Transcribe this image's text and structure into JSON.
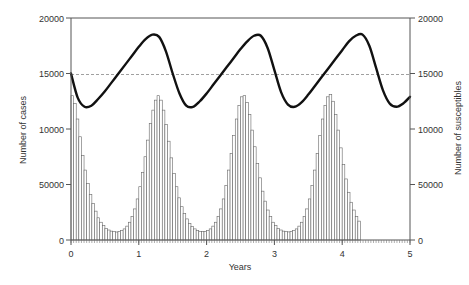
{
  "chart_data": {
    "type": "bar+line",
    "title": "",
    "xlabel": "Years",
    "ylabel_left": "Number of cases",
    "ylabel_right": "Number of susceptibles",
    "xlim": [
      0,
      5
    ],
    "ylim_left": [
      0,
      20000
    ],
    "ylim_right": [
      0,
      20000
    ],
    "x_ticks": [
      "0",
      "1",
      "2",
      "3",
      "4",
      "5"
    ],
    "y_ticks_left": [
      "0",
      "50000",
      "10000",
      "15000",
      "20000"
    ],
    "y_ticks_right": [
      "0",
      "50000",
      "10000",
      "15000",
      "20000"
    ],
    "reference_line": {
      "y": 15000,
      "style": "dashed"
    },
    "grid": false,
    "legend": null,
    "series": [
      {
        "name": "Number of cases",
        "type": "bar",
        "axis": "left",
        "bin_width_years": 0.03846,
        "values": [
          13000,
          12300,
          10900,
          9300,
          7600,
          6300,
          5100,
          4100,
          3300,
          2600,
          2000,
          1600,
          1300,
          1050,
          900,
          800,
          750,
          720,
          750,
          850,
          1000,
          1250,
          1600,
          2100,
          2800,
          3700,
          4800,
          6100,
          7500,
          9000,
          10500,
          11700,
          12600,
          13000,
          12600,
          11700,
          10400,
          8900,
          7400,
          6000,
          4800,
          3800,
          3000,
          2400,
          1900,
          1500,
          1200,
          1000,
          850,
          780,
          750,
          780,
          860,
          1000,
          1250,
          1600,
          2100,
          2800,
          3700,
          4900,
          6300,
          7800,
          9400,
          10900,
          12100,
          12900,
          13000,
          12400,
          11300,
          9900,
          8400,
          6900,
          5600,
          4400,
          3500,
          2700,
          2100,
          1600,
          1300,
          1050,
          900,
          800,
          750,
          730,
          760,
          850,
          1000,
          1250,
          1600,
          2100,
          2800,
          3700,
          4900,
          6300,
          7800,
          9400,
          10900,
          12100,
          12900,
          13100,
          12500,
          11300,
          9900,
          8300,
          6800,
          5500,
          4300,
          3400,
          2700,
          2100,
          1700
        ]
      },
      {
        "name": "Number of susceptibles",
        "type": "line",
        "axis": "right",
        "x": [
          0,
          0.1,
          0.2,
          0.3,
          0.4,
          0.5,
          0.6,
          0.7,
          0.8,
          0.9,
          1.0,
          1.1,
          1.2,
          1.3,
          1.4,
          1.5,
          1.6,
          1.7,
          1.8,
          1.9,
          2.0,
          2.1,
          2.2,
          2.3,
          2.4,
          2.5,
          2.6,
          2.7,
          2.8,
          2.9,
          3.0,
          3.1,
          3.2,
          3.3,
          3.4,
          3.5,
          3.6,
          3.7,
          3.8,
          3.9,
          4.0,
          4.1,
          4.2,
          4.3,
          4.4,
          4.5,
          4.6,
          4.7,
          4.8,
          4.9,
          5.0
        ],
        "values": [
          15000,
          12800,
          12000,
          12100,
          12700,
          13400,
          14200,
          15000,
          15800,
          16600,
          17400,
          18100,
          18500,
          18300,
          17000,
          15000,
          13200,
          12100,
          12000,
          12500,
          13200,
          14000,
          14800,
          15600,
          16400,
          17200,
          17900,
          18400,
          18400,
          17300,
          15300,
          13300,
          12200,
          12000,
          12400,
          13100,
          13900,
          14700,
          15500,
          16300,
          17100,
          17900,
          18400,
          18500,
          17500,
          15500,
          13500,
          12300,
          12000,
          12300,
          12900
        ]
      }
    ]
  },
  "colors": {
    "bar_fill": "#ffffff",
    "bar_stroke": "#666666",
    "line": "#111111",
    "axis": "#555555",
    "reference_line": "#888888"
  }
}
